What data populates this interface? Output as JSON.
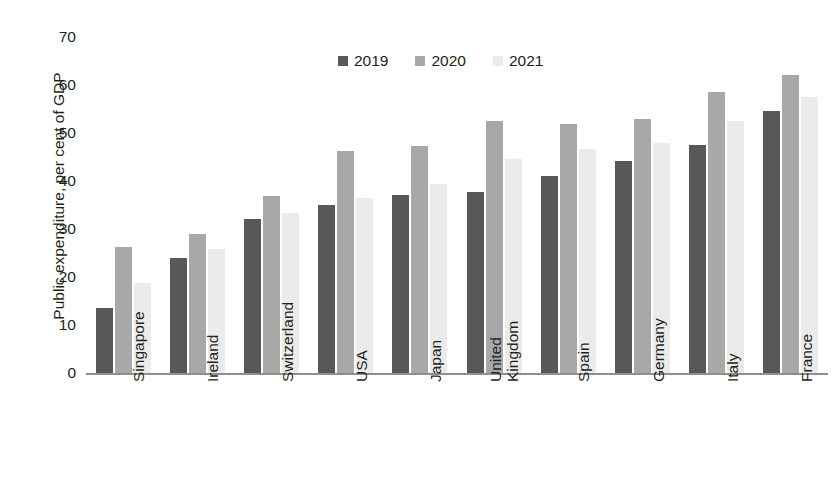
{
  "chart_data": {
    "type": "bar",
    "title": "",
    "xlabel": "",
    "ylabel": "Public expenditure, per cent of GDP",
    "ylim": [
      0,
      70
    ],
    "yticks": [
      70,
      60,
      50,
      40,
      30,
      20,
      10,
      0
    ],
    "grid": false,
    "legend_position": "top-center",
    "categories": [
      "Singapore",
      "Ireland",
      "Switzerland",
      "USA",
      "Japan",
      "United Kingdom",
      "Spain",
      "Germany",
      "Italy",
      "France"
    ],
    "category_lines": [
      [
        "Singapore"
      ],
      [
        "Ireland"
      ],
      [
        "Switzerland"
      ],
      [
        "USA"
      ],
      [
        "Japan"
      ],
      [
        "United",
        "Kingdom"
      ],
      [
        "Spain"
      ],
      [
        "Germany"
      ],
      [
        "Italy"
      ],
      [
        "France"
      ]
    ],
    "series": [
      {
        "name": "2019",
        "color": "#585858",
        "values": [
          13.5,
          24.0,
          32.0,
          35.0,
          37.0,
          37.8,
          41.0,
          44.2,
          47.5,
          54.5
        ]
      },
      {
        "name": "2020",
        "color": "#a8a8a8",
        "values": [
          26.2,
          29.0,
          36.8,
          46.3,
          47.3,
          52.4,
          51.8,
          53.0,
          58.5,
          62.0
        ]
      },
      {
        "name": "2021",
        "color": "#ebebeb",
        "values": [
          18.8,
          25.8,
          33.4,
          36.5,
          39.3,
          44.5,
          46.6,
          48.0,
          52.5,
          57.5
        ]
      }
    ]
  },
  "legend": {
    "items": [
      {
        "label": "2019"
      },
      {
        "label": "2020"
      },
      {
        "label": "2021"
      }
    ]
  }
}
